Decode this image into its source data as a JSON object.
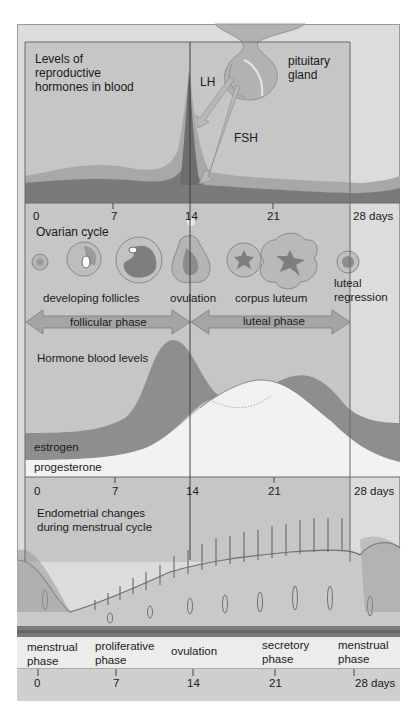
{
  "hormones_panel": {
    "title_line1": "Levels of",
    "title_line2": "reproductive",
    "title_line3": "hormones in blood",
    "gland_line1": "pituitary",
    "gland_line2": "gland",
    "lh_label": "LH",
    "fsh_label": "FSH"
  },
  "axis_top": {
    "t0": "0",
    "t7": "7",
    "t14": "14",
    "t21": "21",
    "t28": "28 days"
  },
  "ovarian": {
    "title": "Ovarian cycle",
    "developing_follicles": "developing follicles",
    "ovulation": "ovulation",
    "corpus_luteum": "corpus luteum",
    "luteal_line1": "luteal",
    "luteal_line2": "regression",
    "follicular_phase": "follicular phase",
    "luteal_phase": "luteal phase"
  },
  "blood_levels": {
    "title": "Hormone blood levels",
    "estrogen": "estrogen",
    "progesterone": "progesterone"
  },
  "axis_mid": {
    "t0": "0",
    "t7": "7",
    "t14": "14",
    "t21": "21",
    "t28": "28 days"
  },
  "endometrial": {
    "title_line1": "Endometrial changes",
    "title_line2": "during menstrual cycle",
    "phases": [
      {
        "line1": "menstrual",
        "line2": "phase"
      },
      {
        "line1": "proliferative",
        "line2": "phase"
      },
      {
        "line1": "ovulation",
        "line2": ""
      },
      {
        "line1": "secretory",
        "line2": "phase"
      },
      {
        "line1": "menstrual",
        "line2": "phase"
      }
    ]
  },
  "axis_bottom": {
    "t0": "0",
    "t7": "7",
    "t14": "14",
    "t21": "21",
    "t28": "28 days"
  },
  "colors": {
    "background": "#dcdcdc",
    "panel": "#c4c4c4",
    "dark_band": "#7c7c7c",
    "mid_band": "#a3a3a3",
    "light_fill": "#efefef"
  }
}
